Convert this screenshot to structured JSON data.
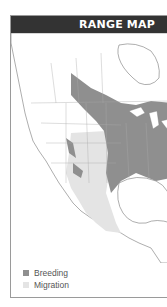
{
  "header": {
    "title": "RANGE MAP"
  },
  "legend": [
    {
      "label": "Breeding",
      "color": "#8f8f8f"
    },
    {
      "label": "Migration",
      "color": "#e4e4e4"
    }
  ],
  "colors": {
    "header_bg": "#333333",
    "breeding": "#8f8f8f",
    "migration": "#e4e4e4",
    "land": "#ffffff",
    "border": "#9a9a9a"
  }
}
